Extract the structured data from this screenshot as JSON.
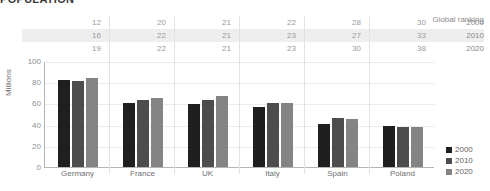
{
  "title": "POPULATION",
  "table": {
    "header": "Global ranking",
    "years": [
      "2000",
      "2010",
      "2020"
    ],
    "rows": [
      [
        "12",
        "20",
        "21",
        "22",
        "28",
        "30"
      ],
      [
        "16",
        "22",
        "21",
        "23",
        "27",
        "33"
      ],
      [
        "19",
        "22",
        "21",
        "23",
        "30",
        "38"
      ]
    ]
  },
  "legend": {
    "items": [
      {
        "label": "2000",
        "color": "#1f1f1f"
      },
      {
        "label": "2010",
        "color": "#4d4d4d"
      },
      {
        "label": "2020",
        "color": "#848484"
      }
    ]
  },
  "axis": {
    "ylabel": "Millions",
    "yticks": [
      "100",
      "80",
      "60",
      "40",
      "20",
      "0"
    ]
  },
  "chart_data": {
    "type": "bar",
    "title": "POPULATION",
    "xlabel": "",
    "ylabel": "Millions",
    "ylim": [
      0,
      100
    ],
    "yticks": [
      0,
      20,
      40,
      60,
      80,
      100
    ],
    "grid": true,
    "legend_position": "right",
    "categories": [
      "Germany",
      "France",
      "UK",
      "Italy",
      "Spain",
      "Poland"
    ],
    "series": [
      {
        "name": "2000",
        "color": "#1f1f1f",
        "values": [
          82,
          60,
          59,
          57,
          41,
          39
        ]
      },
      {
        "name": "2010",
        "color": "#4d4d4d",
        "values": [
          81,
          63,
          63,
          60,
          46,
          38
        ]
      },
      {
        "name": "2020",
        "color": "#848484",
        "values": [
          84,
          65,
          67,
          60,
          45,
          38
        ]
      }
    ],
    "annotations": {
      "global_ranking": {
        "label": "Global ranking",
        "years": [
          "2000",
          "2010",
          "2020"
        ],
        "values": {
          "Germany": [
            12,
            16,
            19
          ],
          "France": [
            20,
            22,
            22
          ],
          "UK": [
            21,
            21,
            21
          ],
          "Italy": [
            22,
            23,
            23
          ],
          "Spain": [
            28,
            27,
            30
          ],
          "Poland": [
            30,
            33,
            38
          ]
        }
      }
    }
  }
}
